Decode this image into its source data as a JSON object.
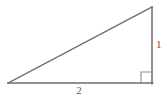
{
  "figure": {
    "name": "right-triangle-diagram",
    "background_color": "#ffffff",
    "stroke_color": "#6e6e6e",
    "stroke_width": 1.4,
    "label_color": "#5a5a5a",
    "width": 167,
    "height": 99
  },
  "vertices": {
    "left": {
      "x": 8,
      "y": 83
    },
    "bottom_right": {
      "x": 152,
      "y": 83
    },
    "top_right": {
      "x": 152,
      "y": 7
    }
  },
  "edges": {
    "base": {
      "label": "2",
      "from": "left",
      "to": "bottom_right"
    },
    "vertical": {
      "label": "1",
      "from": "bottom_right",
      "to": "top_right"
    },
    "hypotenuse": {
      "label": "",
      "from": "left",
      "to": "top_right"
    }
  },
  "right_angle_marker": {
    "name": "right-angle-marker",
    "at": "bottom_right",
    "size": 11,
    "x": 141,
    "y": 72
  }
}
